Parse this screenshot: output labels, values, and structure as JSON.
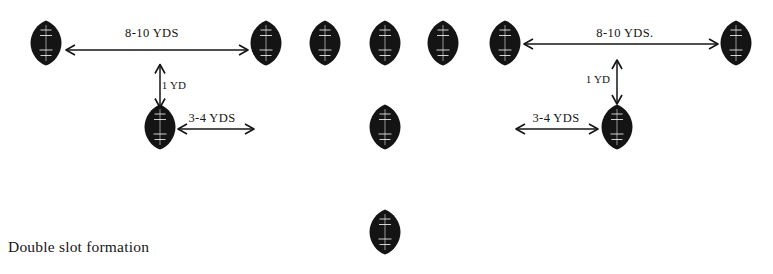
{
  "diagram": {
    "caption": "Double slot formation",
    "caption_pos": {
      "x": 8,
      "y": 238
    },
    "ink_color": "#141414",
    "label_color": "#ffffff",
    "players": [
      {
        "name": "split-end-left",
        "label": "S\nE",
        "x": 46,
        "y": 43
      },
      {
        "name": "left-tackle",
        "label": "L\nT",
        "x": 266,
        "y": 43
      },
      {
        "name": "left-guard",
        "label": "L\nG",
        "x": 325,
        "y": 43
      },
      {
        "name": "center",
        "label": "C",
        "x": 385,
        "y": 43
      },
      {
        "name": "right-guard",
        "label": "R\nG",
        "x": 443,
        "y": 43
      },
      {
        "name": "right-tackle",
        "label": "R\nT",
        "x": 505,
        "y": 43
      },
      {
        "name": "split-end-right",
        "label": "S\nE",
        "x": 736,
        "y": 43
      },
      {
        "name": "slotback-left",
        "label": "S\nB",
        "x": 160,
        "y": 127
      },
      {
        "name": "quarterback",
        "label": "Q\nB",
        "x": 385,
        "y": 127
      },
      {
        "name": "slotback-right",
        "label": "S\nB",
        "x": 617,
        "y": 127
      },
      {
        "name": "fullback",
        "label": "F\nB",
        "x": 385,
        "y": 232
      }
    ],
    "dimensions": [
      {
        "name": "dim-split-left",
        "text": "8-10 YDS",
        "x": 152,
        "y": 33,
        "orient": "horizontal"
      },
      {
        "name": "dim-split-right",
        "text": "8-10 YDS.",
        "x": 625,
        "y": 33,
        "orient": "horizontal"
      },
      {
        "name": "dim-depth-left",
        "text": "1 YD",
        "x": 174,
        "y": 85,
        "orient": "vertical"
      },
      {
        "name": "dim-depth-right",
        "text": "1 YD",
        "x": 598,
        "y": 79,
        "orient": "vertical"
      },
      {
        "name": "dim-inside-left",
        "text": "3-4 YDS",
        "x": 212,
        "y": 118,
        "orient": "horizontal"
      },
      {
        "name": "dim-inside-right",
        "text": "3-4 YDS",
        "x": 556,
        "y": 118,
        "orient": "horizontal"
      }
    ],
    "arrows": [
      {
        "name": "arrow-split-left",
        "x1": 66,
        "y1": 50,
        "x2": 248,
        "y2": 50,
        "kind": "double-horizontal"
      },
      {
        "name": "arrow-split-right",
        "x1": 524,
        "y1": 44,
        "x2": 718,
        "y2": 44,
        "kind": "double-horizontal"
      },
      {
        "name": "arrow-depth-left",
        "x1": 160,
        "y1": 64,
        "x2": 160,
        "y2": 107,
        "kind": "double-vertical"
      },
      {
        "name": "arrow-depth-right",
        "x1": 617,
        "y1": 60,
        "x2": 617,
        "y2": 104,
        "kind": "double-vertical"
      },
      {
        "name": "arrow-inside-left",
        "x1": 178,
        "y1": 129,
        "x2": 254,
        "y2": 129,
        "kind": "double-horizontal"
      },
      {
        "name": "arrow-inside-right",
        "x1": 516,
        "y1": 129,
        "x2": 598,
        "y2": 129,
        "kind": "double-horizontal"
      }
    ]
  }
}
